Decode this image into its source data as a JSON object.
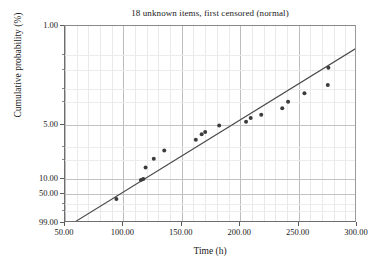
{
  "chart": {
    "title": "18 unknown items, first censored (normal)",
    "xlabel": "Time (h)",
    "ylabel": "Cumulative probability (%)"
  },
  "axes": {
    "x_ticks": [
      "50.00",
      "100.00",
      "150.00",
      "200.00",
      "250.00",
      "300.00"
    ],
    "y_ticks": [
      "99.00",
      "50.00",
      "10.00",
      "5.00",
      "1.00"
    ]
  },
  "chart_data": {
    "type": "scatter",
    "title": "18 unknown items, first censored (normal)",
    "xlabel": "Time (h)",
    "ylabel": "Cumulative probability (%)",
    "xlim": [
      50,
      300
    ],
    "ylim": [
      1,
      99
    ],
    "y_scale": "normal-probability",
    "grid": true,
    "legend": null,
    "x_ticks": [
      50,
      100,
      150,
      200,
      250,
      300
    ],
    "x_minor_tick_step": 10,
    "y_ticks": [
      1,
      5,
      10,
      50,
      99
    ],
    "y_minor_ticks": [
      2,
      3,
      20,
      30,
      70,
      80,
      90,
      95
    ],
    "series": [
      {
        "name": "Median ranks (plotted points)",
        "type": "scatter",
        "marker": "filled-circle",
        "color": "#3c3c3c",
        "points": [
          {
            "x": 94.0,
            "y": 3.9
          },
          {
            "x": 115.0,
            "y": 9.5
          },
          {
            "x": 117.0,
            "y": 9.9
          },
          {
            "x": 119.0,
            "y": 15.5
          },
          {
            "x": 126.0,
            "y": 21.0
          },
          {
            "x": 135.0,
            "y": 27.0
          },
          {
            "x": 162.0,
            "y": 36.0
          },
          {
            "x": 167.0,
            "y": 41.0
          },
          {
            "x": 170.0,
            "y": 43.0
          },
          {
            "x": 182.0,
            "y": 49.0
          },
          {
            "x": 205.0,
            "y": 52.5
          },
          {
            "x": 209.0,
            "y": 56.0
          },
          {
            "x": 218.0,
            "y": 59.0
          },
          {
            "x": 236.0,
            "y": 65.0
          },
          {
            "x": 241.0,
            "y": 70.5
          },
          {
            "x": 255.0,
            "y": 77.0
          },
          {
            "x": 275.0,
            "y": 82.5
          },
          {
            "x": 275.5,
            "y": 91.0
          }
        ]
      },
      {
        "name": "Fitted normal line",
        "type": "line",
        "color": "#4a4a4a",
        "endpoints": [
          {
            "x": 57.0,
            "y": 1.0
          },
          {
            "x": 300.0,
            "y": 96.5
          }
        ]
      }
    ]
  }
}
